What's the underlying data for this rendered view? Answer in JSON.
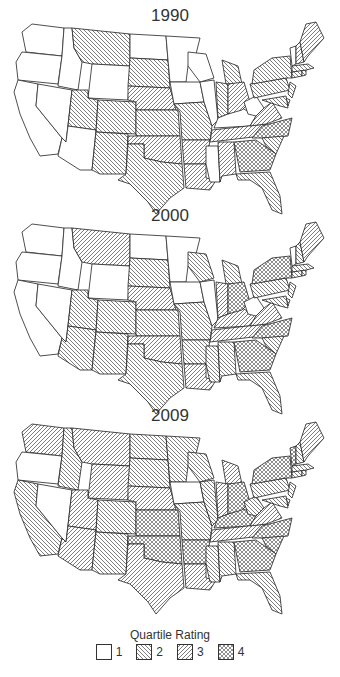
{
  "legend": {
    "title": "Quartile Rating",
    "items": [
      {
        "value": 1,
        "label": "1",
        "pattern": "none"
      },
      {
        "value": 2,
        "label": "2",
        "pattern": "back-diagonal"
      },
      {
        "value": 3,
        "label": "3",
        "pattern": "forward-diagonal"
      },
      {
        "value": 4,
        "label": "4",
        "pattern": "crosshatch"
      }
    ]
  },
  "panels": [
    {
      "title": "1990",
      "ratings": {
        "WA": 1,
        "OR": 1,
        "CA": 1,
        "NV": 1,
        "ID": 1,
        "MT": 2,
        "WY": 1,
        "UT": 2,
        "AZ": 1,
        "CO": 2,
        "NM": 2,
        "ND": 1,
        "SD": 2,
        "NE": 3,
        "KS": 2,
        "OK": 3,
        "TX": 2,
        "MN": 1,
        "IA": 1,
        "MO": 2,
        "AR": 3,
        "LA": 3,
        "WI": 1,
        "IL": 1,
        "MS": 1,
        "MI": 2,
        "IN": 2,
        "KY": 1,
        "TN": 3,
        "AL": 3,
        "OH": 3,
        "WV": 1,
        "VA": 3,
        "NC": 4,
        "SC": 2,
        "GA": 4,
        "FL": 2,
        "PA": 2,
        "NY": 2,
        "NJ": 2,
        "DE": 2,
        "MD": 2,
        "CT": 2,
        "RI": 2,
        "MA": 2,
        "VT": 1,
        "NH": 3,
        "ME": 3
      }
    },
    {
      "title": "2000",
      "ratings": {
        "WA": 1,
        "OR": 1,
        "CA": 1,
        "NV": 1,
        "ID": 1,
        "MT": 3,
        "WY": 1,
        "UT": 2,
        "AZ": 2,
        "CO": 2,
        "NM": 2,
        "ND": 1,
        "SD": 2,
        "NE": 3,
        "KS": 2,
        "OK": 3,
        "TX": 2,
        "MN": 1,
        "IA": 1,
        "MO": 2,
        "AR": 2,
        "LA": 3,
        "WI": 2,
        "IL": 1,
        "MS": 2,
        "MI": 2,
        "IN": 3,
        "KY": 3,
        "TN": 3,
        "AL": 2,
        "OH": 4,
        "WV": 1,
        "VA": 3,
        "NC": 4,
        "SC": 2,
        "GA": 4,
        "FL": 2,
        "PA": 2,
        "NY": 4,
        "NJ": 2,
        "DE": 2,
        "MD": 2,
        "CT": 2,
        "RI": 2,
        "MA": 2,
        "VT": 1,
        "NH": 2,
        "ME": 3
      }
    },
    {
      "title": "2009",
      "ratings": {
        "WA": 3,
        "OR": 1,
        "CA": 2,
        "NV": 1,
        "ID": 2,
        "MT": 3,
        "WY": 3,
        "UT": 3,
        "AZ": 3,
        "CO": 2,
        "NM": 2,
        "ND": 2,
        "SD": 2,
        "NE": 3,
        "KS": 4,
        "OK": 4,
        "TX": 3,
        "MN": 2,
        "IA": 1,
        "MO": 2,
        "AR": 4,
        "LA": 3,
        "WI": 2,
        "IL": 2,
        "MS": 2,
        "MI": 3,
        "IN": 3,
        "KY": 4,
        "TN": 3,
        "AL": 2,
        "OH": 4,
        "WV": 2,
        "VA": 3,
        "NC": 4,
        "SC": 4,
        "GA": 4,
        "FL": 2,
        "PA": 2,
        "NY": 4,
        "NJ": 2,
        "DE": 2,
        "MD": 2,
        "CT": 2,
        "RI": 2,
        "MA": 2,
        "VT": 4,
        "NH": 2,
        "ME": 3
      }
    }
  ]
}
